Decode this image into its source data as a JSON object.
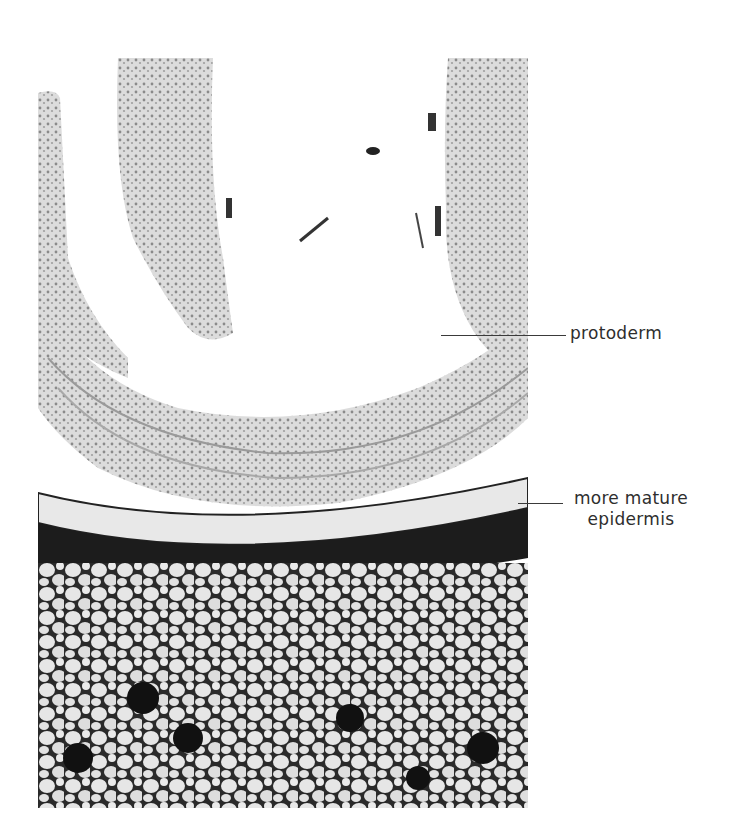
{
  "figure": {
    "type": "micrograph",
    "colors": {
      "background": "#ffffff",
      "light_tissue": "#d9d9d9",
      "dark_layer": "#1a1a1a",
      "cell_wall": "#222222",
      "label_text": "#2e2e2e"
    },
    "labels": [
      {
        "id": "protoderm",
        "text": "protoderm"
      },
      {
        "id": "epidermis",
        "line1": "more mature",
        "line2": "epidermis"
      }
    ]
  }
}
